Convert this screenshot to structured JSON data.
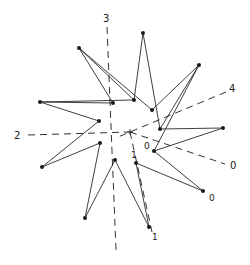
{
  "diagram": {
    "title": "",
    "center": {
      "x": 130,
      "y": 132
    },
    "colors": {
      "stroke": "#2a2a2a",
      "dash": "#333333",
      "vertex": "#1a1a1a",
      "background": "#ffffff"
    },
    "axis_labels": [
      {
        "id": "axis-3",
        "text": "3",
        "x": 103,
        "y": 22
      },
      {
        "id": "axis-4",
        "text": "4",
        "x": 229,
        "y": 92
      },
      {
        "id": "axis-2",
        "text": "2",
        "x": 14,
        "y": 139
      },
      {
        "id": "axis-0",
        "text": "0",
        "x": 230,
        "y": 169
      }
    ],
    "point_labels": [
      {
        "id": "label-0-inner",
        "text": "0",
        "x": 144,
        "y": 149
      },
      {
        "id": "label-1-inner",
        "text": "1",
        "x": 131,
        "y": 158
      },
      {
        "id": "label-0-lower",
        "text": "0",
        "x": 209,
        "y": 201
      },
      {
        "id": "label-1-bottom",
        "text": "1",
        "x": 152,
        "y": 240
      }
    ],
    "vertices": [
      {
        "id": "P1",
        "x": 143,
        "y": 33
      },
      {
        "id": "P2",
        "x": 79,
        "y": 48
      },
      {
        "id": "P3",
        "x": 199,
        "y": 65
      },
      {
        "id": "P4",
        "x": 40,
        "y": 102
      },
      {
        "id": "P5",
        "x": 113,
        "y": 103
      },
      {
        "id": "P6",
        "x": 134,
        "y": 100
      },
      {
        "id": "P7",
        "x": 152,
        "y": 110
      },
      {
        "id": "P8",
        "x": 99,
        "y": 121
      },
      {
        "id": "P9",
        "x": 160,
        "y": 129
      },
      {
        "id": "P10",
        "x": 223,
        "y": 128
      },
      {
        "id": "P11",
        "x": 100,
        "y": 143
      },
      {
        "id": "P12",
        "x": 154,
        "y": 151
      },
      {
        "id": "P13",
        "x": 42,
        "y": 167
      },
      {
        "id": "P14",
        "x": 115,
        "y": 160
      },
      {
        "id": "P15",
        "x": 136,
        "y": 163
      },
      {
        "id": "P16",
        "x": 203,
        "y": 191
      },
      {
        "id": "P17",
        "x": 85,
        "y": 218
      },
      {
        "id": "P18",
        "x": 149,
        "y": 227
      }
    ],
    "dashed_axes": [
      {
        "id": "axis-line-3",
        "x1": 107,
        "y1": 27,
        "x2": 116,
        "y2": 250
      },
      {
        "id": "axis-line-2",
        "x1": 28,
        "y1": 135,
        "x2": 130,
        "y2": 132
      },
      {
        "id": "axis-line-4",
        "x1": 226,
        "y1": 92,
        "x2": 118,
        "y2": 137
      },
      {
        "id": "axis-line-0",
        "x1": 130,
        "y1": 132,
        "x2": 225,
        "y2": 164
      },
      {
        "id": "axis-line-1",
        "x1": 130,
        "y1": 132,
        "x2": 152,
        "y2": 232
      }
    ]
  }
}
